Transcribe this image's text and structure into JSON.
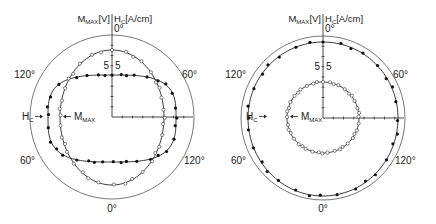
{
  "chart_data": [
    {
      "type": "polar",
      "panel": "left",
      "header": {
        "left": "M",
        "left_sub": "MAX",
        "left_unit": "[V]",
        "right": "H",
        "right_sub": "C",
        "right_unit": "[A/cm]"
      },
      "angle_labels": {
        "top": "0°",
        "upper_left": "120°",
        "upper_right": "60°",
        "lower_left": "60°",
        "lower_right": "120°",
        "bottom": "0°"
      },
      "scale_labels": {
        "left": "5",
        "right": "5"
      },
      "center": [
        112,
        117
      ],
      "outer_radius": 82,
      "axis_ticks": 8,
      "series": [
        {
          "name": "H_C",
          "label": "H",
          "label_sub": "C",
          "marker": "filled",
          "shape": "superellipse",
          "rx": 64,
          "ry_top": 42,
          "ry_bottom": 45,
          "exponent": 3.2,
          "n_points": 36,
          "label_pos": [
            34,
            120
          ]
        },
        {
          "name": "M_MAX",
          "label": "M",
          "label_sub": "MAX",
          "marker": "open",
          "shape": "ellipse",
          "rx": 52,
          "ry_top": 67,
          "ry_bottom": 68,
          "exponent": 2,
          "n_points": 36,
          "label_pos": [
            67,
            120
          ]
        }
      ]
    },
    {
      "type": "polar",
      "panel": "right",
      "header": {
        "left": "M",
        "left_sub": "MAX",
        "left_unit": "[V]",
        "right": "H",
        "right_sub": "C",
        "right_unit": "[A/cm]"
      },
      "angle_labels": {
        "top": "0°",
        "upper_left": "120°",
        "upper_right": "60°",
        "lower_left": "60°",
        "lower_right": "120°",
        "bottom": "0°"
      },
      "scale_labels": {
        "left": "5",
        "right": "5"
      },
      "center": [
        323,
        118
      ],
      "outer_radius": 82,
      "axis_ticks": 8,
      "series": [
        {
          "name": "H_C",
          "label": "H",
          "label_sub": "C",
          "marker": "filled",
          "shape": "ellipse",
          "rx": 75,
          "ry_top": 76,
          "ry_bottom": 78,
          "exponent": 2,
          "n_points": 32,
          "label_pos": [
            258,
            120
          ]
        },
        {
          "name": "M_MAX",
          "label": "M",
          "label_sub": "MAX",
          "marker": "open",
          "shape": "ellipse",
          "rx": 36,
          "ry_top": 36,
          "ry_bottom": 35,
          "exponent": 2,
          "n_points": 40,
          "label_pos": [
            294,
            120
          ]
        }
      ]
    }
  ]
}
